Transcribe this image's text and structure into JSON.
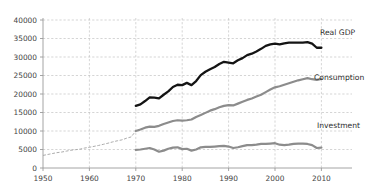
{
  "chart_data": {
    "type": "line",
    "title": "",
    "subtitle": "",
    "xlabel": "",
    "ylabel": "",
    "xlim": [
      1950,
      2013
    ],
    "ylim": [
      0,
      40000
    ],
    "grid": true,
    "legend_position": "inline-right",
    "y_ticks": [
      "0",
      "5000",
      "10000",
      "15000",
      "20000",
      "25000",
      "30000",
      "35000",
      "40000"
    ],
    "y_tick_values": [
      0,
      5000,
      10000,
      15000,
      20000,
      25000,
      30000,
      35000,
      40000
    ],
    "x_ticks": [
      "1950",
      "1960",
      "1970",
      "1980",
      "1990",
      "2000",
      "2010"
    ],
    "x_tick_values": [
      1950,
      1960,
      1970,
      1980,
      1990,
      2000,
      2010
    ],
    "colors": {
      "real_gdp": "#141414",
      "consumption": "#8c8c8c",
      "investment": "#8c8c8c",
      "gridline": "#b9b9b9",
      "axis": "#9a9a9a",
      "background": "#ffffff"
    },
    "series": [
      {
        "name": "Real GDP",
        "label": "Real GDP",
        "color": "#141414",
        "style": "solid-thick",
        "x": [
          1970,
          1971,
          1972,
          1973,
          1974,
          1975,
          1976,
          1977,
          1978,
          1979,
          1980,
          1981,
          1982,
          1983,
          1984,
          1985,
          1986,
          1987,
          1988,
          1989,
          1990,
          1991,
          1992,
          1993,
          1994,
          1995,
          1996,
          1997,
          1998,
          1999,
          2000,
          2001,
          2002,
          2003,
          2004,
          2005,
          2006,
          2007,
          2008,
          2009,
          2010
        ],
        "values": [
          16800,
          17200,
          18200,
          19200,
          19100,
          19000,
          20000,
          20900,
          22100,
          22700,
          22600,
          23200,
          22700,
          23700,
          25400,
          26400,
          27300,
          28200,
          29400,
          30400,
          30900,
          30800,
          31900,
          32800,
          34100,
          34900,
          36200,
          37800,
          39500,
          41300,
          42900,
          43300,
          44000,
          45200,
          46900,
          48400,
          49700,
          50800,
          50400,
          48900,
          50300
        ],
        "pixel_values": [
          16800,
          17200,
          18100,
          19100,
          19000,
          18800,
          19800,
          20700,
          21900,
          22500,
          22400,
          23000,
          22400,
          23500,
          25100,
          26000,
          26700,
          27300,
          28100,
          28700,
          28500,
          28300,
          29100,
          29700,
          30500,
          30900,
          31500,
          32200,
          33000,
          33400,
          33600,
          33400,
          33700,
          33900,
          33900,
          33900,
          33900,
          34000,
          33600,
          32500,
          32500
        ]
      },
      {
        "name": "Consumption",
        "label": "Consumption",
        "color": "#8c8c8c",
        "style": "solid-thick",
        "x": [
          1970,
          1971,
          1972,
          1973,
          1974,
          1975,
          1976,
          1977,
          1978,
          1979,
          1980,
          1981,
          1982,
          1983,
          1984,
          1985,
          1986,
          1987,
          1988,
          1989,
          1990,
          1991,
          1992,
          1993,
          1994,
          1995,
          1996,
          1997,
          1998,
          1999,
          2000,
          2001,
          2002,
          2003,
          2004,
          2005,
          2006,
          2007,
          2008,
          2009,
          2010
        ],
        "values": [
          10000,
          10400,
          10900,
          11200,
          11100,
          11400,
          11900,
          12300,
          12700,
          12900,
          12800,
          12900,
          13100,
          13800,
          14300,
          14900,
          15500,
          15900,
          16400,
          16800,
          17000,
          16900,
          17400,
          17900,
          18400,
          18800,
          19300,
          19800,
          20500,
          21200,
          21800,
          22100,
          22500,
          22900,
          23300,
          23700,
          24000,
          24300,
          24000,
          23800,
          24100
        ]
      },
      {
        "name": "Investment",
        "label": "Investment",
        "color": "#8c8c8c",
        "style": "solid-thick",
        "x": [
          1970,
          1971,
          1972,
          1973,
          1974,
          1975,
          1976,
          1977,
          1978,
          1979,
          1980,
          1981,
          1982,
          1983,
          1984,
          1985,
          1986,
          1987,
          1988,
          1989,
          1990,
          1991,
          1992,
          1993,
          1994,
          1995,
          1996,
          1997,
          1998,
          1999,
          2000,
          2001,
          2002,
          2003,
          2004,
          2005,
          2006,
          2007,
          2008,
          2009,
          2010
        ],
        "values": [
          4900,
          5000,
          5300,
          5500,
          5100,
          4400,
          4800,
          5300,
          5600,
          5700,
          5100,
          5200,
          4600,
          5000,
          5800,
          5900,
          5900,
          6000,
          6100,
          6200,
          6000,
          5400,
          5600,
          6000,
          6400,
          6500,
          6700,
          7000,
          7400,
          7700,
          8000,
          7500,
          7400,
          7600,
          8000,
          8300,
          8400,
          8200,
          7600,
          6000,
          6500
        ],
        "pixel_values": [
          4900,
          5000,
          5200,
          5400,
          5000,
          4400,
          4700,
          5200,
          5500,
          5600,
          5100,
          5200,
          4700,
          5000,
          5600,
          5700,
          5700,
          5800,
          5900,
          6000,
          5800,
          5400,
          5600,
          5900,
          6200,
          6200,
          6300,
          6500,
          6500,
          6600,
          6700,
          6300,
          6200,
          6300,
          6500,
          6600,
          6600,
          6500,
          6200,
          5400,
          5500
        ]
      },
      {
        "name": "Consumption (early, estimated)",
        "label": "",
        "color": "#a7a7a7",
        "style": "dashed-thin",
        "x": [
          1950,
          1951,
          1952,
          1953,
          1954,
          1955,
          1956,
          1957,
          1958,
          1959,
          1960,
          1961,
          1962,
          1963,
          1964,
          1965,
          1966,
          1967,
          1968,
          1969,
          1970
        ],
        "values": [
          3400,
          3700,
          3900,
          4200,
          4300,
          4600,
          4800,
          5000,
          5100,
          5400,
          5600,
          5800,
          6100,
          6400,
          6700,
          7100,
          7400,
          7600,
          8000,
          8400,
          10000
        ],
        "pixel_values": [
          3400,
          3650,
          3900,
          4150,
          4300,
          4550,
          4800,
          4950,
          5100,
          5400,
          5600,
          5850,
          6100,
          6400,
          6700,
          7050,
          7350,
          7600,
          8050,
          8400,
          10000
        ]
      }
    ]
  }
}
